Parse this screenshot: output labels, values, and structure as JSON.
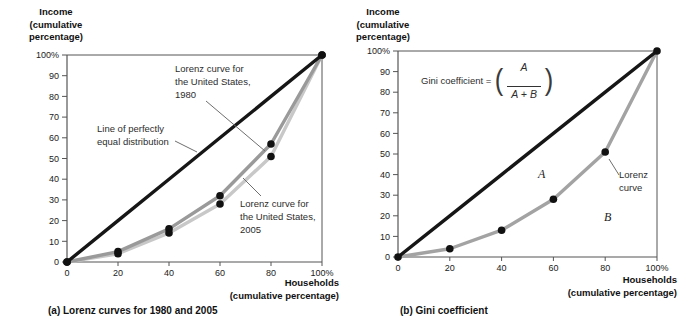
{
  "chart_data": [
    {
      "type": "line",
      "caption": "(a) Lorenz curves for 1980 and 2005",
      "ylabel": "Income\n(cumulative\npercentage)",
      "xlabel": "Households\n(cumulative percentage)",
      "x": [
        0,
        20,
        40,
        60,
        80,
        100
      ],
      "series": [
        {
          "name": "Line of perfectly equal distribution",
          "values": [
            0,
            20,
            40,
            60,
            80,
            100
          ],
          "color": "#161616",
          "markers": false
        },
        {
          "name": "Lorenz curve for the United States, 1980",
          "values": [
            0,
            5,
            16,
            32,
            57,
            100
          ],
          "color": "#9a9a9a",
          "markers": true
        },
        {
          "name": "Lorenz curve for the United States, 2005",
          "values": [
            0,
            4,
            14,
            28,
            51,
            100
          ],
          "color": "#c8c8c8",
          "markers": true
        }
      ],
      "xlim": [
        0,
        100
      ],
      "ylim": [
        0,
        100
      ],
      "xticks": [
        "0",
        "20",
        "40",
        "60",
        "80",
        "100%"
      ],
      "yticks": [
        "0",
        "10",
        "20",
        "30",
        "40",
        "50",
        "60",
        "70",
        "80",
        "90",
        "100%"
      ],
      "grid": false,
      "legend": "inline annotations with leader lines",
      "annotations": {
        "curve_1980": "Lorenz curve for\nthe United States,\n1980",
        "equality": "Line of perfectly\nequal distribution",
        "curve_2005": "Lorenz curve for\nthe United States,\n2005"
      },
      "marker_color": "#111111"
    },
    {
      "type": "line",
      "caption": "(b) Gini coefficient",
      "ylabel": "Income\n(cumulative\npercentage)",
      "xlabel": "Households\n(cumulative percentage)",
      "x": [
        0,
        20,
        40,
        60,
        80,
        100
      ],
      "series": [
        {
          "name": "Line of perfectly equal distribution",
          "values": [
            0,
            20,
            40,
            60,
            80,
            100
          ],
          "color": "#161616",
          "markers": false
        },
        {
          "name": "Lorenz curve",
          "values": [
            0,
            4,
            13,
            28,
            51,
            100
          ],
          "color": "#a3a3a3",
          "markers": true
        }
      ],
      "xlim": [
        0,
        100
      ],
      "ylim": [
        0,
        100
      ],
      "xticks": [
        "0",
        "20",
        "40",
        "60",
        "80",
        "100%"
      ],
      "yticks": [
        "0",
        "10",
        "20",
        "30",
        "40",
        "50",
        "60",
        "70",
        "80",
        "90",
        "100%"
      ],
      "grid": false,
      "legend": "inline annotations with leader lines",
      "formula": {
        "prefix": "Gini coefficient =",
        "paren_open": "(",
        "numerator": "A",
        "denominator": "A + B",
        "paren_close": ")"
      },
      "annotations": {
        "area_a": "A",
        "area_b": "B",
        "lorenz": "Lorenz\ncurve"
      },
      "marker_color": "#111111"
    }
  ],
  "colors": {
    "frame": "#555555",
    "tick_text": "#222222",
    "leader_line": "#6e6e6e"
  }
}
